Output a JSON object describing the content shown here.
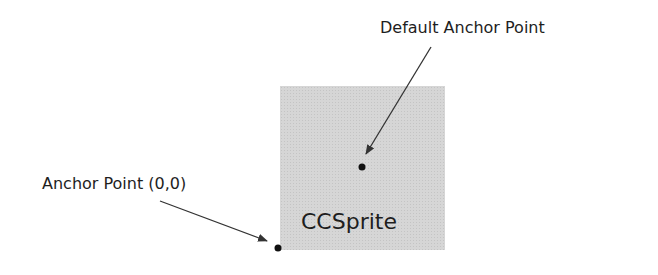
{
  "diagram": {
    "sprite": {
      "label": "CCSprite",
      "fill": "#d6d6d6"
    },
    "annotations": [
      {
        "label": "Default Anchor Point",
        "point": [
          362,
          167
        ]
      },
      {
        "label": "Anchor Point (0,0)",
        "point": [
          278,
          248
        ]
      }
    ],
    "colors": {
      "text": "#1e1e1e",
      "arrow": "#333333",
      "dot": "#111111"
    }
  }
}
